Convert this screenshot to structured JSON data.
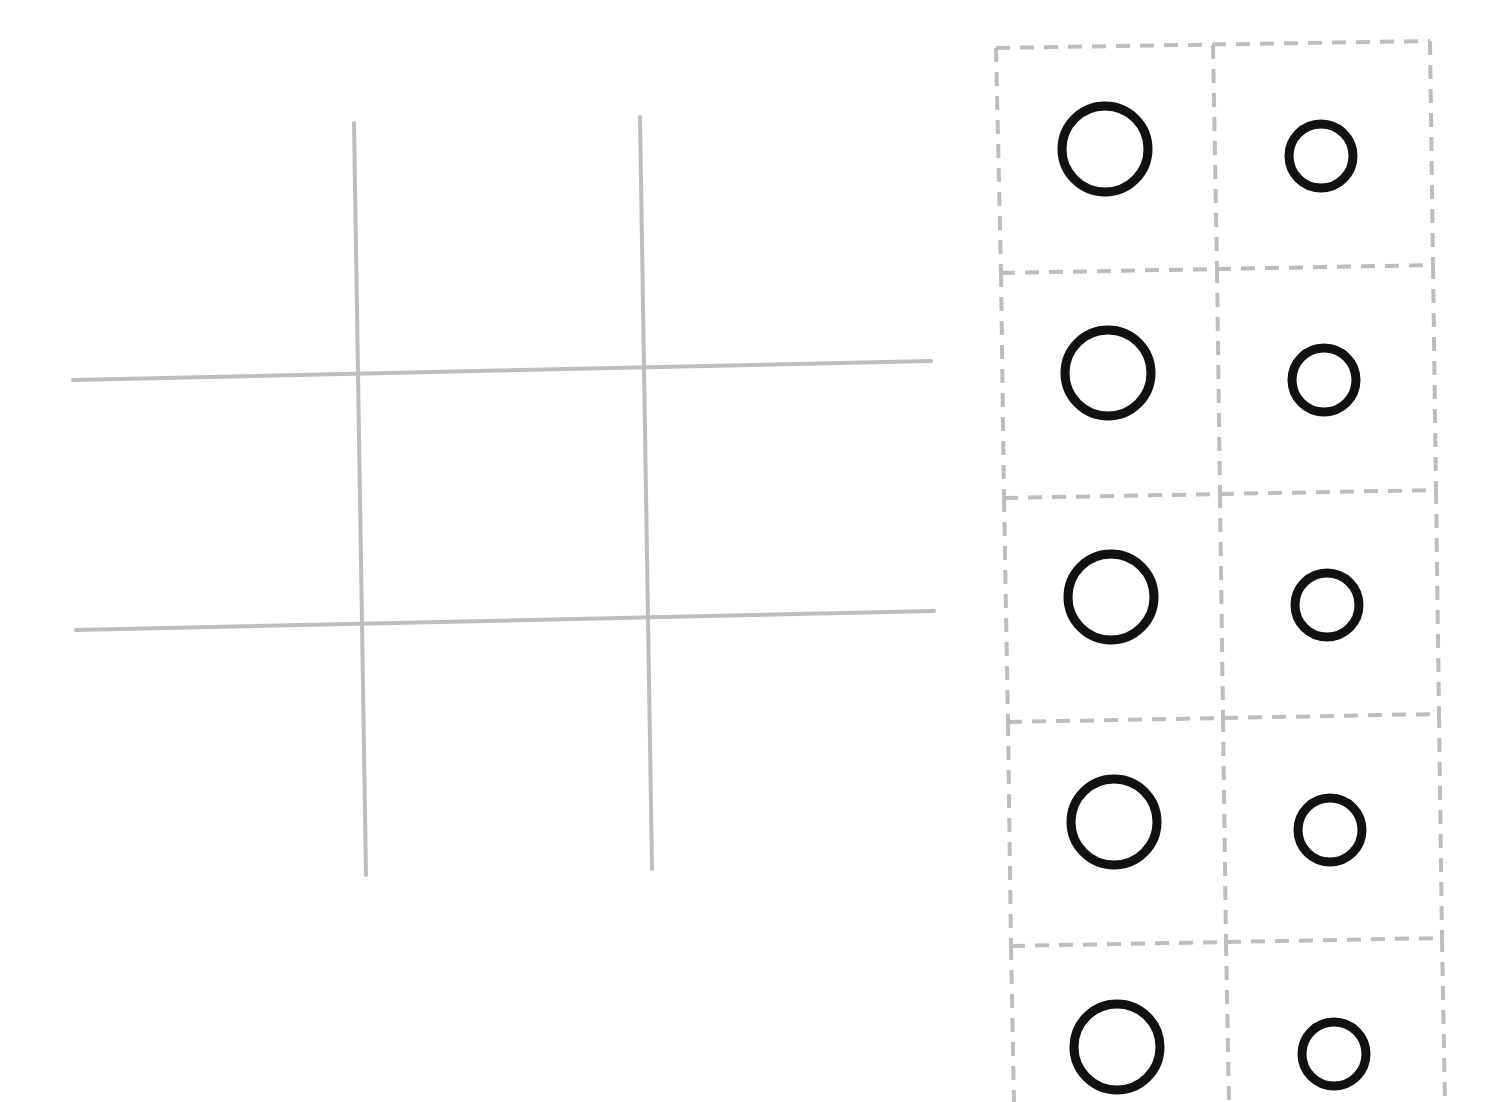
{
  "game": {
    "type": "tic-tac-toe",
    "board": {
      "grid_color": "#bdbdbd",
      "grid_width": 4,
      "vertical_lines": [
        {
          "x1": 354,
          "y1": 123,
          "x2": 366,
          "y2": 875
        },
        {
          "x1": 640,
          "y1": 117,
          "x2": 652,
          "y2": 869
        }
      ],
      "horizontal_lines": [
        {
          "x1": 73,
          "y1": 380,
          "x2": 931,
          "y2": 361
        },
        {
          "x1": 76,
          "y1": 630,
          "x2": 934,
          "y2": 611
        }
      ],
      "cells": [
        {
          "row": 0,
          "col": 0,
          "cx": 215,
          "cy": 250,
          "piece": ""
        },
        {
          "row": 0,
          "col": 1,
          "cx": 498,
          "cy": 245,
          "piece": ""
        },
        {
          "row": 0,
          "col": 2,
          "cx": 787,
          "cy": 240,
          "piece": ""
        },
        {
          "row": 1,
          "col": 0,
          "cx": 218,
          "cy": 500,
          "piece": ""
        },
        {
          "row": 1,
          "col": 1,
          "cx": 502,
          "cy": 495,
          "piece": ""
        },
        {
          "row": 1,
          "col": 2,
          "cx": 790,
          "cy": 490,
          "piece": ""
        },
        {
          "row": 2,
          "col": 0,
          "cx": 221,
          "cy": 750,
          "piece": ""
        },
        {
          "row": 2,
          "col": 1,
          "cx": 506,
          "cy": 745,
          "piece": ""
        },
        {
          "row": 2,
          "col": 2,
          "cx": 793,
          "cy": 740,
          "piece": ""
        }
      ]
    },
    "tray": {
      "border_color": "#bdbdbd",
      "piece_color": "#111111",
      "piece_stroke": 9,
      "rows": [
        {
          "top_left": [
            996,
            48
          ],
          "top_mid": [
            1213,
            45
          ],
          "top_right": [
            1430,
            41
          ],
          "pieces": [
            {
              "cx": 1105,
              "cy": 149,
              "r": 43,
              "size": "large"
            },
            {
              "cx": 1321,
              "cy": 156,
              "r": 32,
              "size": "small"
            }
          ]
        },
        {
          "top_left": [
            1001,
            273
          ],
          "top_mid": [
            1217,
            269
          ],
          "top_right": [
            1433,
            265
          ],
          "pieces": [
            {
              "cx": 1108,
              "cy": 373,
              "r": 43,
              "size": "large"
            },
            {
              "cx": 1324,
              "cy": 380,
              "r": 32,
              "size": "small"
            }
          ]
        },
        {
          "top_left": [
            1004,
            498
          ],
          "top_mid": [
            1220,
            494
          ],
          "top_right": [
            1436,
            490
          ],
          "pieces": [
            {
              "cx": 1111,
              "cy": 597,
              "r": 43,
              "size": "large"
            },
            {
              "cx": 1327,
              "cy": 605,
              "r": 32,
              "size": "small"
            }
          ]
        },
        {
          "top_left": [
            1008,
            722
          ],
          "top_mid": [
            1223,
            718
          ],
          "top_right": [
            1439,
            714
          ],
          "pieces": [
            {
              "cx": 1114,
              "cy": 822,
              "r": 43,
              "size": "large"
            },
            {
              "cx": 1330,
              "cy": 830,
              "r": 32,
              "size": "small"
            }
          ]
        },
        {
          "top_left": [
            1011,
            946
          ],
          "top_mid": [
            1226,
            942
          ],
          "top_right": [
            1442,
            938
          ],
          "pieces": [
            {
              "cx": 1117,
              "cy": 1047,
              "r": 43,
              "size": "large"
            },
            {
              "cx": 1334,
              "cy": 1054,
              "r": 32,
              "size": "small"
            }
          ]
        }
      ],
      "bottom": 1102
    }
  }
}
